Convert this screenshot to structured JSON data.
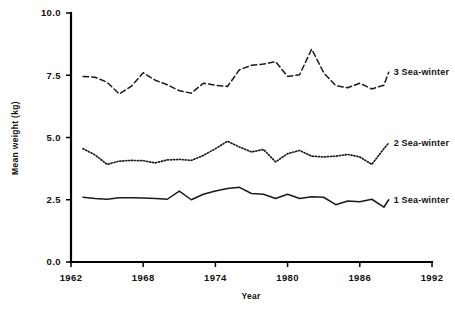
{
  "chart_data": {
    "type": "line",
    "title": "",
    "xlabel": "Year",
    "ylabel": "Mean weight (kg)",
    "xlim": [
      1962,
      1992
    ],
    "ylim": [
      0.0,
      10.0
    ],
    "xticks": [
      1962,
      1968,
      1974,
      1980,
      1986,
      1992
    ],
    "xtick_labels": [
      "1962",
      "1968",
      "1974",
      "1980",
      "1986",
      "1992"
    ],
    "yticks": [
      0.0,
      2.5,
      5.0,
      7.5,
      10.0
    ],
    "ytick_labels": [
      "0.0",
      "2.5",
      "5.0",
      "7.5",
      "10.0"
    ],
    "grid": false,
    "legend_position": "right-inline-labels",
    "x": [
      1963,
      1964,
      1965,
      1966,
      1967,
      1968,
      1969,
      1970,
      1971,
      1972,
      1973,
      1974,
      1975,
      1976,
      1977,
      1978,
      1979,
      1980,
      1981,
      1982,
      1983,
      1984,
      1985,
      1986,
      1987,
      1988
    ],
    "series": [
      {
        "name": "1 Sea-winter",
        "label": "1 Sea-winter",
        "linestyle": "solid",
        "color": "#1a1a1a",
        "values": [
          2.6,
          2.55,
          2.52,
          2.58,
          2.58,
          2.57,
          2.55,
          2.52,
          2.85,
          2.5,
          2.72,
          2.85,
          2.95,
          3.0,
          2.75,
          2.72,
          2.55,
          2.72,
          2.55,
          2.62,
          2.6,
          2.3,
          2.45,
          2.42,
          2.52,
          2.2
        ]
      },
      {
        "name": "2 Sea-winter",
        "label": "2 Sea-winter",
        "linestyle": "dotted",
        "color": "#1a1a1a",
        "values": [
          4.55,
          4.3,
          3.92,
          4.05,
          4.08,
          4.07,
          3.98,
          4.1,
          4.12,
          4.08,
          4.28,
          4.55,
          4.85,
          4.62,
          4.42,
          4.52,
          4.02,
          4.35,
          4.48,
          4.25,
          4.22,
          4.25,
          4.32,
          4.22,
          3.92,
          4.55
        ]
      },
      {
        "name": "3 Sea-winter",
        "label": "3 Sea-winter",
        "linestyle": "dashed",
        "color": "#1a1a1a",
        "values": [
          7.45,
          7.42,
          7.22,
          6.75,
          7.05,
          7.6,
          7.3,
          7.12,
          6.88,
          6.78,
          7.18,
          7.1,
          7.05,
          7.72,
          7.9,
          7.95,
          8.05,
          7.45,
          7.52,
          8.55,
          7.6,
          7.08,
          7.0,
          7.18,
          6.95,
          7.1
        ]
      }
    ],
    "series_tail_extension": {
      "1 Sea-winter": [
        1988.4,
        2.5
      ],
      "2 Sea-winter": [
        1988.4,
        4.78
      ],
      "3 Sea-winter": [
        1988.4,
        7.62
      ]
    }
  },
  "labels": {
    "y_axis_title": "Mean weight (kg)",
    "x_axis_title": "Year"
  }
}
